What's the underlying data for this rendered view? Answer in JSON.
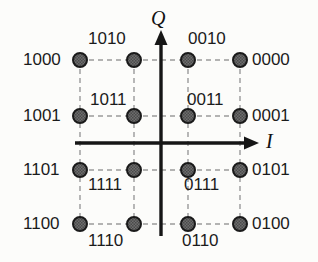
{
  "figure": {
    "type": "constellation-diagram",
    "modulation": "16-QAM",
    "background_color": "#fcfcfa",
    "dot_fill_color": "#6e6e6e",
    "dot_stroke_color": "#1a1a1a",
    "grid_color": "#9a9a9a",
    "axis_color": "#161616"
  },
  "axes": {
    "horizontal": {
      "label": "I",
      "name": "in-phase-axis",
      "y_px": 143,
      "x_start_px": 75,
      "x_end_px": 255,
      "arrow": "right",
      "label_x_px": 266,
      "label_y_px": 131
    },
    "vertical": {
      "label": "Q",
      "name": "quadrature-axis",
      "x_px": 161,
      "y_start_px": 236,
      "y_end_px": 34,
      "arrow": "up",
      "label_x_px": 151,
      "label_y_px": 8
    }
  },
  "grid": {
    "columns_px": [
      80,
      134,
      188,
      240
    ],
    "rows_px": [
      60,
      116,
      170,
      224
    ],
    "dot_radius_px": 7,
    "dashed": true
  },
  "chart_data": {
    "type": "scatter",
    "xlabel": "I",
    "ylabel": "Q",
    "xlim": [
      -3,
      3
    ],
    "ylim": [
      -3,
      3
    ],
    "grid": true,
    "legend": "none",
    "x": [
      -3,
      -1,
      1,
      3,
      -3,
      -1,
      1,
      3,
      -3,
      -1,
      1,
      3,
      -3,
      -1,
      1,
      3
    ],
    "y": [
      3,
      3,
      3,
      3,
      1,
      1,
      1,
      1,
      -1,
      -1,
      -1,
      -1,
      -3,
      -3,
      -3,
      -3
    ],
    "point_labels": [
      "1000",
      "1010",
      "0010",
      "0000",
      "1001",
      "1011",
      "0011",
      "0001",
      "1101",
      "1111",
      "0111",
      "0101",
      "1100",
      "1110",
      "0110",
      "0100"
    ]
  },
  "points": [
    {
      "bits": "1000",
      "col": 0,
      "row": 0,
      "cx": 80,
      "cy": 60,
      "label_x": 23,
      "label_y": 51,
      "pos": "left"
    },
    {
      "bits": "1010",
      "col": 1,
      "row": 0,
      "cx": 134,
      "cy": 60,
      "label_x": 88,
      "label_y": 30,
      "pos": "above"
    },
    {
      "bits": "0010",
      "col": 2,
      "row": 0,
      "cx": 188,
      "cy": 60,
      "label_x": 188,
      "label_y": 30,
      "pos": "above"
    },
    {
      "bits": "0000",
      "col": 3,
      "row": 0,
      "cx": 240,
      "cy": 60,
      "label_x": 252,
      "label_y": 51,
      "pos": "right"
    },
    {
      "bits": "1001",
      "col": 0,
      "row": 1,
      "cx": 80,
      "cy": 116,
      "label_x": 23,
      "label_y": 107,
      "pos": "left"
    },
    {
      "bits": "1011",
      "col": 1,
      "row": 1,
      "cx": 134,
      "cy": 116,
      "label_x": 90,
      "label_y": 91,
      "pos": "above"
    },
    {
      "bits": "0011",
      "col": 2,
      "row": 1,
      "cx": 188,
      "cy": 116,
      "label_x": 187,
      "label_y": 91,
      "pos": "above"
    },
    {
      "bits": "0001",
      "col": 3,
      "row": 1,
      "cx": 240,
      "cy": 116,
      "label_x": 252,
      "label_y": 107,
      "pos": "right"
    },
    {
      "bits": "1101",
      "col": 0,
      "row": 2,
      "cx": 80,
      "cy": 170,
      "label_x": 23,
      "label_y": 161,
      "pos": "left"
    },
    {
      "bits": "1111",
      "col": 1,
      "row": 2,
      "cx": 134,
      "cy": 170,
      "label_x": 88,
      "label_y": 176,
      "pos": "below"
    },
    {
      "bits": "0111",
      "col": 2,
      "row": 2,
      "cx": 188,
      "cy": 170,
      "label_x": 184,
      "label_y": 176,
      "pos": "below"
    },
    {
      "bits": "0101",
      "col": 3,
      "row": 2,
      "cx": 240,
      "cy": 170,
      "label_x": 252,
      "label_y": 161,
      "pos": "right"
    },
    {
      "bits": "1100",
      "col": 0,
      "row": 3,
      "cx": 80,
      "cy": 224,
      "label_x": 23,
      "label_y": 215,
      "pos": "left"
    },
    {
      "bits": "1110",
      "col": 1,
      "row": 3,
      "cx": 134,
      "cy": 224,
      "label_x": 88,
      "label_y": 232,
      "pos": "below"
    },
    {
      "bits": "0110",
      "col": 2,
      "row": 3,
      "cx": 188,
      "cy": 224,
      "label_x": 182,
      "label_y": 232,
      "pos": "below"
    },
    {
      "bits": "0100",
      "col": 3,
      "row": 3,
      "cx": 240,
      "cy": 224,
      "label_x": 252,
      "label_y": 215,
      "pos": "right"
    }
  ]
}
